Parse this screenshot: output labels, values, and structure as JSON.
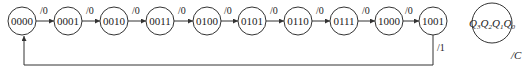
{
  "diagram": {
    "type": "state-transition",
    "states": [
      {
        "id": "s0",
        "label": "0000"
      },
      {
        "id": "s1",
        "label": "0001"
      },
      {
        "id": "s2",
        "label": "0010"
      },
      {
        "id": "s3",
        "label": "0011"
      },
      {
        "id": "s4",
        "label": "0100"
      },
      {
        "id": "s5",
        "label": "0101"
      },
      {
        "id": "s6",
        "label": "0110"
      },
      {
        "id": "s7",
        "label": "0111"
      },
      {
        "id": "s8",
        "label": "1000"
      },
      {
        "id": "s9",
        "label": "1001"
      }
    ],
    "transitions": [
      {
        "from": "0000",
        "to": "0001",
        "label": "/0"
      },
      {
        "from": "0001",
        "to": "0010",
        "label": "/0"
      },
      {
        "from": "0010",
        "to": "0011",
        "label": "/0"
      },
      {
        "from": "0011",
        "to": "0100",
        "label": "/0"
      },
      {
        "from": "0100",
        "to": "0101",
        "label": "/0"
      },
      {
        "from": "0101",
        "to": "0110",
        "label": "/0"
      },
      {
        "from": "0110",
        "to": "0111",
        "label": "/0"
      },
      {
        "from": "0111",
        "to": "1000",
        "label": "/0"
      },
      {
        "from": "1000",
        "to": "1001",
        "label": "/0"
      },
      {
        "from": "1001",
        "to": "0000",
        "label": "/1"
      }
    ],
    "legend": {
      "state_label": "Q3Q2Q1Q0",
      "output_label": "/C"
    },
    "colors": {
      "stroke": "#333333",
      "text": "#222222",
      "background": "#ffffff"
    }
  }
}
